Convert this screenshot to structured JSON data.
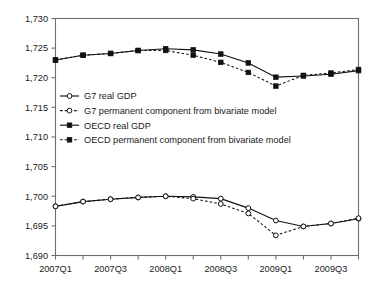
{
  "chart_data": {
    "type": "line",
    "title": "",
    "xlabel": "",
    "ylabel": "",
    "grid": false,
    "legend_position": "inside-upper-left",
    "ylim": [
      1690,
      1730
    ],
    "yticks": [
      1690,
      1695,
      1700,
      1705,
      1710,
      1715,
      1720,
      1725,
      1730
    ],
    "ytick_labels": [
      "1,690",
      "1,695",
      "1,700",
      "1,705",
      "1,710",
      "1,715",
      "1,720",
      "1,725",
      "1,730"
    ],
    "x": [
      "2007Q1",
      "2007Q2",
      "2007Q3",
      "2007Q4",
      "2008Q1",
      "2008Q2",
      "2008Q3",
      "2008Q4",
      "2009Q1",
      "2009Q2",
      "2009Q3",
      "2009Q4"
    ],
    "xtick_labels": [
      "2007Q1",
      "2007Q3",
      "2008Q1",
      "2008Q3",
      "2009Q1",
      "2009Q3"
    ],
    "xtick_indices": [
      0,
      2,
      4,
      6,
      8,
      10
    ],
    "series": [
      {
        "name": "G7 real GDP",
        "marker": "circle-open",
        "style": "solid",
        "values": [
          1698.3,
          1699.1,
          1699.5,
          1699.8,
          1700.0,
          1699.9,
          1699.6,
          1698.0,
          1695.9,
          1694.9,
          1695.4,
          1696.2
        ]
      },
      {
        "name": "G7 permanent component from bivariate model",
        "marker": "circle-open",
        "style": "dashed",
        "values": [
          1698.3,
          1699.1,
          1699.5,
          1699.8,
          1700.0,
          1699.6,
          1698.7,
          1697.1,
          1693.4,
          1694.9,
          1695.4,
          1696.3
        ]
      },
      {
        "name": "OECD real GDP",
        "marker": "square-filled",
        "style": "solid",
        "values": [
          1723.0,
          1723.8,
          1724.1,
          1724.6,
          1724.9,
          1724.7,
          1724.0,
          1722.5,
          1720.1,
          1720.3,
          1720.6,
          1721.2
        ]
      },
      {
        "name": "OECD permanent component from bivariate model",
        "marker": "square-filled",
        "style": "dashed",
        "values": [
          1723.0,
          1723.8,
          1724.1,
          1724.6,
          1724.6,
          1723.8,
          1722.6,
          1720.9,
          1718.6,
          1720.4,
          1720.8,
          1721.4
        ]
      }
    ]
  },
  "legend": {
    "items": [
      {
        "label": "G7 real GDP"
      },
      {
        "label": "G7 permanent component from bivariate model"
      },
      {
        "label": "OECD real GDP"
      },
      {
        "label": "OECD permanent component from bivariate model"
      }
    ]
  },
  "colors": {
    "line": "#111111",
    "axis": "#6e6e6e",
    "background": "#ffffff",
    "text": "#1a1a1a"
  }
}
